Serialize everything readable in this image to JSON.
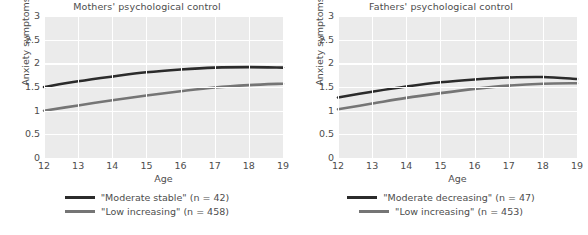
{
  "figure": {
    "background": "#ffffff",
    "panel_background": "#ebebeb",
    "gridline_color": "#ffffff",
    "text_color": "#4d4d4d"
  },
  "chart_data": [
    {
      "type": "line",
      "title": "Mothers' psychological control",
      "xlabel": "Age",
      "ylabel": "Anxiety symptoms",
      "xlim": [
        12,
        19
      ],
      "ylim": [
        0,
        3
      ],
      "xticks": [
        "12",
        "13",
        "14",
        "15",
        "16",
        "17",
        "18",
        "19"
      ],
      "yticks": [
        "0",
        "0.5",
        "1",
        "1.5",
        "2",
        "2.5",
        "3"
      ],
      "grid": true,
      "legend_position": "bottom",
      "x": [
        12,
        13,
        14,
        15,
        16,
        17,
        18,
        19
      ],
      "series": [
        {
          "name": "\"Moderate stable\" (n = 42)",
          "label": "\"Moderate stable\"",
          "n": 42,
          "color": "#2b2b2b",
          "values": [
            1.5,
            1.62,
            1.72,
            1.81,
            1.87,
            1.91,
            1.92,
            1.91
          ]
        },
        {
          "name": "\"Low increasing\" (n = 458)",
          "label": "\"Low increasing\"",
          "n": 458,
          "color": "#757575",
          "values": [
            1.0,
            1.11,
            1.22,
            1.32,
            1.41,
            1.49,
            1.54,
            1.57
          ]
        }
      ]
    },
    {
      "type": "line",
      "title": "Fathers' psychological control",
      "xlabel": "Age",
      "ylabel": "Anxiety symptoms",
      "xlim": [
        12,
        19
      ],
      "ylim": [
        0,
        3
      ],
      "xticks": [
        "12",
        "13",
        "14",
        "15",
        "16",
        "17",
        "18",
        "19"
      ],
      "yticks": [
        "0",
        "0.5",
        "1",
        "1.5",
        "2",
        "2.5",
        "3"
      ],
      "grid": true,
      "legend_position": "bottom",
      "x": [
        12,
        13,
        14,
        15,
        16,
        17,
        18,
        19
      ],
      "series": [
        {
          "name": "\"Moderate decreasing\" (n = 47)",
          "label": "\"Moderate decreasing\"",
          "n": 47,
          "color": "#2b2b2b",
          "values": [
            1.28,
            1.4,
            1.51,
            1.6,
            1.66,
            1.7,
            1.71,
            1.67
          ]
        },
        {
          "name": "\"Low increasing\" (n = 453)",
          "label": "\"Low increasing\"",
          "n": 453,
          "color": "#757575",
          "values": [
            1.03,
            1.15,
            1.27,
            1.37,
            1.46,
            1.53,
            1.57,
            1.58
          ]
        }
      ]
    }
  ]
}
